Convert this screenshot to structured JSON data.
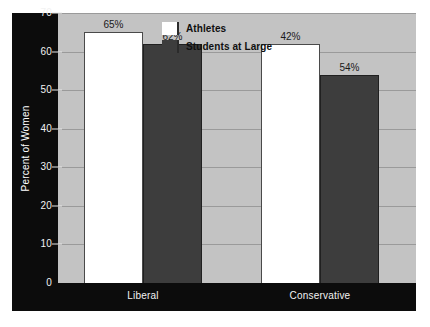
{
  "chart_data": {
    "type": "bar",
    "title": "",
    "xlabel": "",
    "ylabel": "Percent of Women",
    "ylim": [
      0,
      70
    ],
    "yticks": [
      0,
      10,
      20,
      30,
      40,
      50,
      60,
      70
    ],
    "ytick_labels": [
      "0",
      "10",
      "20",
      "30",
      "40",
      "50",
      "60",
      "70"
    ],
    "grid": true,
    "legend_position": "top-center-right",
    "categories": [
      "Liberal",
      "Conservative"
    ],
    "series": [
      {
        "name": "Athletes",
        "color": "#ffffff",
        "values": [
          65,
          62
        ],
        "labels": [
          "65%",
          "42%"
        ]
      },
      {
        "name": "Students at Large",
        "color": "#3d3d3d",
        "values": [
          62,
          54
        ],
        "labels": [
          "62%",
          "54%"
        ]
      }
    ],
    "bars": [
      {
        "category": "Liberal",
        "series": "Athletes",
        "value": 65,
        "label": "65%"
      },
      {
        "category": "Liberal",
        "series": "Students at Large",
        "value": 62,
        "label": "62%"
      },
      {
        "category": "Conservative",
        "series": "Athletes",
        "value": 42,
        "label": "42%"
      },
      {
        "category": "Conservative",
        "series": "Students at Large",
        "value": 54,
        "label": "54%"
      }
    ]
  },
  "legend": {
    "items": [
      {
        "label": "Athletes",
        "swatch": "light"
      },
      {
        "label": "Students at Large",
        "swatch": "dark"
      }
    ]
  },
  "colors": {
    "plot_background": "#c3c3c3",
    "panel": "#0c0c0c",
    "gridline": "#9a9a9a",
    "series_light": "#ffffff",
    "series_dark": "#3d3d3d",
    "tick_text": "#f2f2f2",
    "value_text": "#1a1a1a"
  }
}
